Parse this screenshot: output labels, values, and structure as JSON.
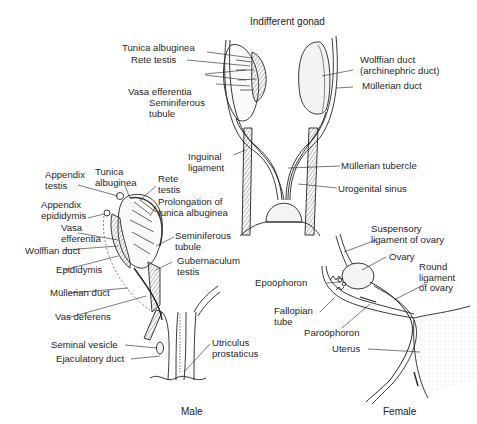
{
  "panels": {
    "indifferent": {
      "title": "Indifferent gonad",
      "labels": {
        "tunica_albuginea": "Tunica albuginea",
        "rete_testis": "Rete testis",
        "vasa_efferentia": "Vasa efferentia",
        "seminiferous_tubule": "Seminiferous\ntubule",
        "wolffian_duct": "Wolffian duct\n(archinephric duct)",
        "mullerian_duct": "Müllerian duct",
        "inguinal_ligament": "Inguinal\nligament",
        "mullerian_tubercle": "Müllerian tubercle",
        "urogenital_sinus": "Urogenital sinus"
      }
    },
    "male": {
      "title": "Male",
      "labels": {
        "appendix_testis": "Appendix\ntestis",
        "tunica_albuginea": "Tunica\nalbuginea",
        "rete_testis": "Rete\ntestis",
        "prolongation": "Prolongation of\ntunica albuginea",
        "appendix_epididymis": "Appendix\nepididymis",
        "vasa_efferentia": "Vasa\nefferentia",
        "wolffian_duct": "Wolffian duct",
        "seminiferous_tubule": "Seminiferous\ntubule",
        "epididymis": "Epididymis",
        "gubernaculum": "Gubernaculum\ntestis",
        "mullerian_duct": "Müllerian duct",
        "vas_deferens": "Vas deferens",
        "seminal_vesicle": "Seminal vesicle",
        "ejaculatory_duct": "Ejaculatory duct",
        "utriculus": "Utriculus\nprostaticus"
      }
    },
    "female": {
      "title": "Female",
      "labels": {
        "suspensory": "Suspensory\nligament of ovary",
        "ovary": "Ovary",
        "epoophoron": "Epoöphoron",
        "round_ligament": "Round\nligament\nof ovary",
        "fallopian_tube": "Fallopian\ntube",
        "paroophoron": "Paroöphoron",
        "uterus": "Uterus"
      }
    }
  }
}
